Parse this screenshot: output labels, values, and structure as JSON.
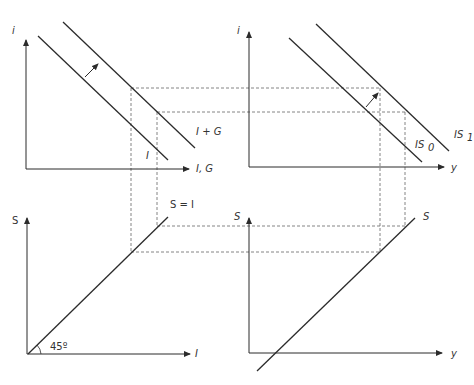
{
  "diagram": {
    "panels": {
      "top_left": {
        "y_axis_label": "i",
        "x_axis_label": "I, G",
        "curves": [
          {
            "label": "I"
          },
          {
            "label": "I + G"
          }
        ]
      },
      "top_right": {
        "y_axis_label": "i",
        "x_axis_label": "y",
        "curves": [
          {
            "label": "IS",
            "sub": "0"
          },
          {
            "label": "IS",
            "sub": "1"
          }
        ]
      },
      "bottom_left": {
        "y_axis_label": "S",
        "x_axis_label": "I",
        "curve_label": "S = I",
        "angle_label": "45º"
      },
      "bottom_right": {
        "y_axis_label": "S",
        "x_axis_label": "y",
        "curve_label": "S"
      }
    },
    "colors": {
      "line": "#2b2b2b",
      "dashed": "#555555",
      "text": "#333333"
    }
  }
}
